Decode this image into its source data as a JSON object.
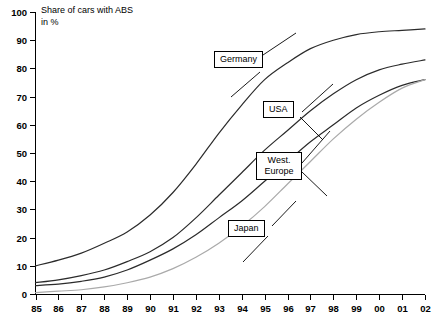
{
  "chart": {
    "title_line1": "Share of cars with ABS",
    "title_line2": "in %"
  },
  "labels": {
    "germany": "Germany",
    "usa": "USA",
    "west_europe_line1": "West.",
    "west_europe_line2": "Europe",
    "japan": "Japan"
  },
  "chart_data": {
    "type": "line",
    "title": "Share of cars with ABS in %",
    "xlabel": "",
    "ylabel": "in %",
    "ylim": [
      0,
      100
    ],
    "grid": false,
    "legend_position": "inline-callout-boxes",
    "categories": [
      "85",
      "86",
      "87",
      "88",
      "89",
      "90",
      "91",
      "92",
      "93",
      "94",
      "95",
      "96",
      "97",
      "98",
      "99",
      "00",
      "01",
      "02"
    ],
    "yticks": [
      0,
      10,
      20,
      30,
      40,
      50,
      60,
      70,
      80,
      90,
      100
    ],
    "series": [
      {
        "name": "Germany",
        "color": "#2b2b2b",
        "values": [
          10,
          12,
          14.5,
          18,
          22,
          28,
          36,
          46,
          57,
          67,
          76,
          82,
          87,
          90,
          92,
          93,
          93.5,
          94
        ]
      },
      {
        "name": "USA",
        "color": "#2b2b2b",
        "values": [
          4,
          5,
          6.5,
          8.5,
          11.5,
          15,
          20,
          27,
          35,
          43,
          51,
          58,
          65,
          71,
          76,
          79.5,
          81.5,
          83
        ]
      },
      {
        "name": "West. Europe",
        "color": "#2b2b2b",
        "values": [
          3,
          3.5,
          4.5,
          6,
          8.5,
          12,
          16,
          21,
          27,
          33,
          40,
          47,
          54,
          60,
          66,
          70.5,
          74,
          76
        ]
      },
      {
        "name": "Japan",
        "color": "#aaaaaa",
        "values": [
          0.5,
          1,
          1.5,
          2.5,
          4,
          6,
          9,
          13,
          18,
          24,
          31,
          39,
          47,
          55,
          62,
          68,
          73,
          76
        ]
      }
    ]
  }
}
